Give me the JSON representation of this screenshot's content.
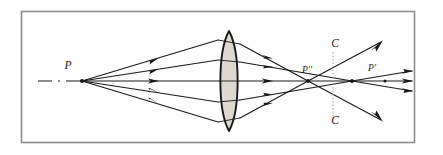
{
  "figure": {
    "frame": {
      "border_color": "#8c8c8c",
      "background_color": "#fefefe",
      "x": 21,
      "y": 11,
      "width": 394,
      "height": 132
    },
    "labels": [
      {
        "id": "source-point",
        "text": "P",
        "x": 68,
        "y": 69,
        "font_size": 11
      },
      {
        "id": "marginal-focus",
        "text": "P''",
        "x": 307,
        "y": 72,
        "font_size": 9
      },
      {
        "id": "paraxial-focus",
        "text": "P'",
        "x": 372,
        "y": 71,
        "font_size": 9
      },
      {
        "id": "confusion-circle-top",
        "text": "C",
        "x": 335,
        "y": 46,
        "font_size": 11
      },
      {
        "id": "confusion-circle-bottom",
        "text": "C",
        "x": 335,
        "y": 122,
        "font_size": 11
      }
    ],
    "colors": {
      "ray": "#1a1a1a",
      "lens_outline": "#1a1a1a",
      "lens_fill": "#ddd9d0",
      "axis": "#1a1a1a",
      "guide": "#9a9a9a",
      "frame": "#8c8c8c",
      "paper": "#fefefe"
    },
    "lens": {
      "id": "biconvex-lens",
      "center_x": 229,
      "top_y": 31,
      "bottom_y": 131,
      "half_thickness": 11
    },
    "optical_axis": {
      "y": 81,
      "x_start": 38,
      "x_end": 412
    },
    "source": {
      "x": 82,
      "y": 81
    },
    "confusion_line": {
      "x": 333,
      "y_top": 52,
      "y_bottom": 116
    },
    "rays": [
      {
        "id": "marginal-ray-upper",
        "height_at_lens": 41,
        "focus_x": 308
      },
      {
        "id": "zonal-ray-upper",
        "height_at_lens": 21,
        "focus_x": 352
      },
      {
        "id": "axial-ray",
        "height_at_lens": 0,
        "focus_x": 412
      },
      {
        "id": "zonal-ray-lower",
        "height_at_lens": -21,
        "focus_x": 352
      },
      {
        "id": "marginal-ray-lower",
        "height_at_lens": -41,
        "focus_x": 308
      }
    ],
    "incoming_arrow_x": 155,
    "outgoing_arrow_x": 268
  }
}
